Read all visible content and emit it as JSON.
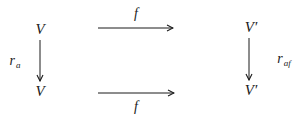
{
  "diagram": {
    "type": "commutative-square",
    "nodes": {
      "top_left": "V",
      "bottom_left": "V",
      "top_right": "V′",
      "bottom_right": "V′"
    },
    "arrows": {
      "top": {
        "label": "f",
        "from": "top_left",
        "to": "top_right"
      },
      "bottom": {
        "label": "f",
        "from": "bottom_left",
        "to": "bottom_right"
      },
      "left": {
        "label_base": "r",
        "label_sub": "a",
        "from": "top_left",
        "to": "bottom_left"
      },
      "right": {
        "label_base": "r",
        "label_sub": "af",
        "from": "top_right",
        "to": "bottom_right"
      }
    },
    "colors": {
      "ink": "#1a1a1a",
      "background": "#ffffff"
    }
  }
}
